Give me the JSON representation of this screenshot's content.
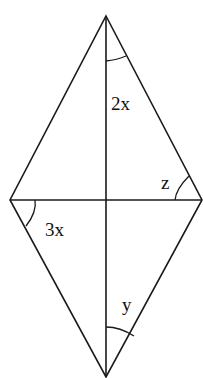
{
  "diagram": {
    "type": "rhombus-with-diagonals",
    "vertices": {
      "top": [
        106,
        16
      ],
      "right": [
        202,
        200
      ],
      "bottom": [
        106,
        377
      ],
      "left": [
        10,
        200
      ],
      "center": [
        106,
        200
      ]
    },
    "labels": {
      "top_angle": "2x",
      "right_angle": "z",
      "left_angle": "3x",
      "bottom_angle": "y"
    },
    "stroke_color": "#1a1a1a",
    "background": "#ffffff"
  }
}
